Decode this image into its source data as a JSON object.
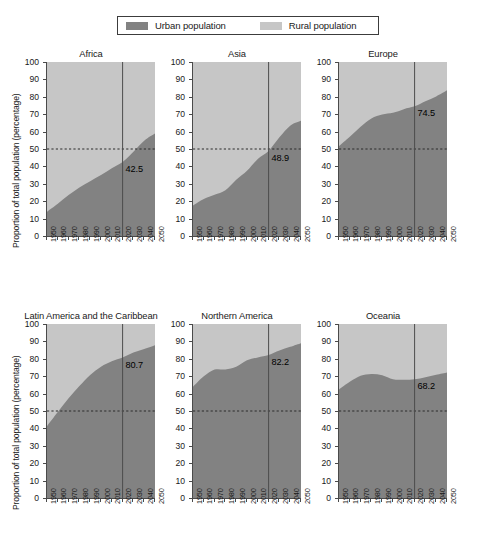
{
  "legend": {
    "entries": [
      {
        "label": "Urban population",
        "color": "#828282",
        "icon": "square-swatch"
      },
      {
        "label": "Rural population",
        "color": "#c6c6c6",
        "icon": "square-swatch"
      }
    ]
  },
  "axis": {
    "ylabel": "Proportion of total population (percentage)",
    "yticks": [
      "100",
      "90",
      "80",
      "70",
      "60",
      "50",
      "40",
      "30",
      "20",
      "10",
      "0"
    ],
    "xticks": [
      "1950",
      "1960",
      "1970",
      "1980",
      "1990",
      "2000",
      "2010",
      "2020",
      "2030",
      "2040",
      "2050"
    ]
  },
  "reference": {
    "vertical_year": 2020,
    "horizontal_value": 50
  },
  "chart_data": {
    "type": "area",
    "title": "",
    "xlabel": "",
    "ylabel": "Proportion of total population (percentage)",
    "xlim": [
      1950,
      2050
    ],
    "ylim": [
      0,
      100
    ],
    "grid": false,
    "legend_position": "top",
    "stacked": true,
    "annotations": {
      "reference_line_vertical": 2020,
      "reference_line_horizontal": 50
    },
    "x": [
      1950,
      1960,
      1970,
      1980,
      1990,
      2000,
      2010,
      2020,
      2030,
      2040,
      2050
    ],
    "panels": [
      {
        "title": "Africa",
        "label_2020": "42.5",
        "series": [
          {
            "name": "Urban population",
            "values": [
              14.0,
              18.6,
              23.5,
              27.9,
              31.5,
              35.0,
              38.9,
              42.5,
              48.4,
              54.8,
              58.9
            ]
          },
          {
            "name": "Rural population",
            "values": [
              86.0,
              81.4,
              76.5,
              72.1,
              68.5,
              65.0,
              61.1,
              57.5,
              51.6,
              45.2,
              41.1
            ]
          }
        ]
      },
      {
        "title": "Asia",
        "label_2020": "48.9",
        "series": [
          {
            "name": "Urban population",
            "values": [
              17.5,
              21.2,
              23.7,
              26.3,
              32.3,
              37.5,
              44.3,
              48.9,
              56.7,
              63.4,
              66.2
            ]
          },
          {
            "name": "Rural population",
            "values": [
              82.5,
              78.8,
              76.3,
              73.7,
              67.7,
              62.5,
              55.7,
              51.1,
              43.3,
              36.6,
              33.8
            ]
          }
        ]
      },
      {
        "title": "Europe",
        "label_2020": "74.5",
        "series": [
          {
            "name": "Urban population",
            "values": [
              51.7,
              57.1,
              62.8,
              67.6,
              69.8,
              70.8,
              72.9,
              74.5,
              77.5,
              80.2,
              83.7
            ]
          },
          {
            "name": "Rural population",
            "values": [
              48.3,
              42.9,
              37.2,
              32.4,
              30.2,
              29.2,
              27.1,
              25.5,
              22.5,
              19.8,
              16.3
            ]
          }
        ]
      },
      {
        "title": "Latin America and the Caribbean",
        "label_2020": "80.7",
        "series": [
          {
            "name": "Urban population",
            "values": [
              41.3,
              49.4,
              57.3,
              64.3,
              70.7,
              75.5,
              78.6,
              80.7,
              83.6,
              85.6,
              87.8
            ]
          },
          {
            "name": "Rural population",
            "values": [
              58.7,
              50.6,
              42.7,
              35.7,
              29.3,
              24.5,
              21.4,
              19.3,
              16.4,
              14.4,
              12.2
            ]
          }
        ]
      },
      {
        "title": "Northern America",
        "label_2020": "82.2",
        "series": [
          {
            "name": "Urban population",
            "values": [
              63.9,
              69.9,
              73.8,
              73.9,
              75.4,
              79.1,
              80.8,
              82.2,
              84.7,
              86.9,
              89.0
            ]
          },
          {
            "name": "Rural population",
            "values": [
              36.1,
              30.1,
              26.2,
              26.1,
              24.6,
              20.9,
              19.2,
              17.8,
              15.3,
              13.1,
              11.0
            ]
          }
        ]
      },
      {
        "title": "Oceania",
        "label_2020": "68.2",
        "series": [
          {
            "name": "Urban population",
            "values": [
              62.4,
              66.8,
              70.3,
              71.3,
              70.6,
              68.3,
              67.9,
              68.2,
              69.4,
              70.8,
              72.1
            ]
          },
          {
            "name": "Rural population",
            "values": [
              37.6,
              33.2,
              29.7,
              28.7,
              29.4,
              31.7,
              32.1,
              31.8,
              30.6,
              29.2,
              27.9
            ]
          }
        ]
      }
    ]
  }
}
